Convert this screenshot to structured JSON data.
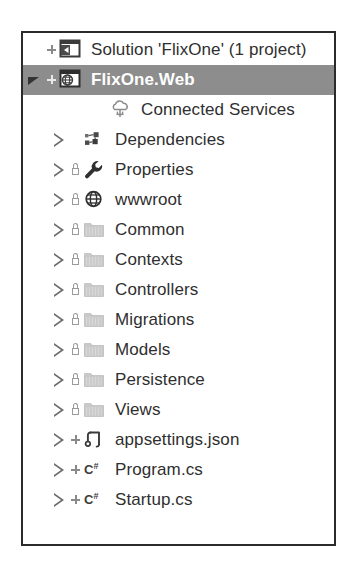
{
  "panel": {
    "name": "Solution Explorer tree",
    "border_color": "#2b2b2b",
    "background": "#ffffff",
    "selection_color": "#8d8d8d",
    "selection_text_color": "#ffffff",
    "text_color": "#2f2f2f"
  },
  "tree": {
    "nodes": [
      {
        "label": "Solution 'FlixOne' (1 project)",
        "icon": "solution-icon",
        "depth": 0,
        "expander": "none",
        "source_control": "plus",
        "locked": false,
        "selected": false
      },
      {
        "label": "FlixOne.Web",
        "icon": "web-project-icon",
        "depth": 0,
        "expander": "expanded",
        "source_control": "plus",
        "locked": false,
        "selected": true
      },
      {
        "label": "Connected Services",
        "icon": "connected-services-icon",
        "depth": 2,
        "expander": "none",
        "source_control": "none",
        "locked": false,
        "selected": false
      },
      {
        "label": "Dependencies",
        "icon": "dependencies-icon",
        "depth": 1,
        "expander": "collapsed",
        "source_control": "none",
        "locked": false,
        "selected": false
      },
      {
        "label": "Properties",
        "icon": "wrench-icon",
        "depth": 1,
        "expander": "collapsed",
        "source_control": "none",
        "locked": true,
        "selected": false
      },
      {
        "label": "wwwroot",
        "icon": "globe-icon",
        "depth": 1,
        "expander": "collapsed",
        "source_control": "none",
        "locked": true,
        "selected": false
      },
      {
        "label": "Common",
        "icon": "folder-icon",
        "depth": 1,
        "expander": "collapsed",
        "source_control": "none",
        "locked": true,
        "selected": false
      },
      {
        "label": "Contexts",
        "icon": "folder-icon",
        "depth": 1,
        "expander": "collapsed",
        "source_control": "none",
        "locked": true,
        "selected": false
      },
      {
        "label": "Controllers",
        "icon": "folder-icon",
        "depth": 1,
        "expander": "collapsed",
        "source_control": "none",
        "locked": true,
        "selected": false
      },
      {
        "label": "Migrations",
        "icon": "folder-icon",
        "depth": 1,
        "expander": "collapsed",
        "source_control": "none",
        "locked": true,
        "selected": false
      },
      {
        "label": "Models",
        "icon": "folder-icon",
        "depth": 1,
        "expander": "collapsed",
        "source_control": "none",
        "locked": true,
        "selected": false
      },
      {
        "label": "Persistence",
        "icon": "folder-icon",
        "depth": 1,
        "expander": "collapsed",
        "source_control": "none",
        "locked": true,
        "selected": false
      },
      {
        "label": "Views",
        "icon": "folder-icon",
        "depth": 1,
        "expander": "collapsed",
        "source_control": "none",
        "locked": true,
        "selected": false
      },
      {
        "label": "appsettings.json",
        "icon": "json-file-icon",
        "depth": 1,
        "expander": "collapsed",
        "source_control": "plus",
        "locked": false,
        "selected": false
      },
      {
        "label": "Program.cs",
        "icon": "csharp-file-icon",
        "depth": 1,
        "expander": "collapsed",
        "source_control": "plus",
        "locked": false,
        "selected": false
      },
      {
        "label": "Startup.cs",
        "icon": "csharp-file-icon",
        "depth": 1,
        "expander": "collapsed",
        "source_control": "plus",
        "locked": false,
        "selected": false
      }
    ]
  }
}
